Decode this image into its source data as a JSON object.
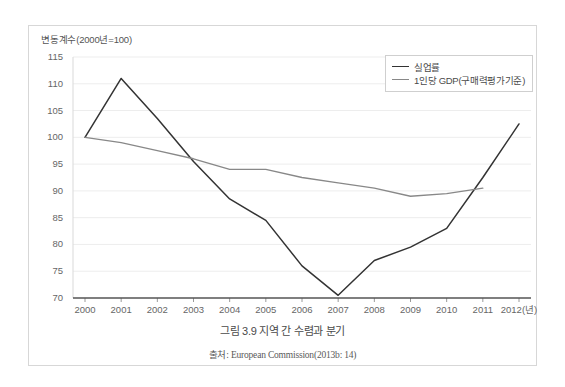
{
  "figure": {
    "caption": "그림 3.9 지역 간 수렴과 분기",
    "source": "출처: European Commission(2013b: 14)"
  },
  "colors": {
    "unemployment_line": "#333333",
    "gdp_line": "#888888",
    "gridline": "#ededed",
    "axis": "#555555",
    "frame_border": "#d7d7d7",
    "legend_border": "#cfcfcf",
    "tick_text": "#666666"
  },
  "chart_data": {
    "type": "line",
    "title": "변동계수(2000년=100)",
    "xlabel": "(년)",
    "ylabel": "변동계수(2000년=100)",
    "ylim": [
      70,
      115
    ],
    "xlim": [
      2000,
      2012
    ],
    "grid": true,
    "legend_position": "top-right",
    "yticks": [
      115,
      110,
      105,
      100,
      95,
      90,
      85,
      80,
      75,
      70
    ],
    "xticks": [
      "2000",
      "2001",
      "2002",
      "2003",
      "2004",
      "2005",
      "2006",
      "2007",
      "2008",
      "2009",
      "2010",
      "2011",
      "2012(년)"
    ],
    "x": [
      2000,
      2001,
      2002,
      2003,
      2004,
      2005,
      2006,
      2007,
      2008,
      2009,
      2010,
      2011,
      2012
    ],
    "series": [
      {
        "name": "실업률",
        "color": "#333333",
        "values": [
          100,
          111,
          103.5,
          95.5,
          88.5,
          84.5,
          76,
          70.5,
          77,
          79.5,
          83,
          92.5,
          102.5
        ]
      },
      {
        "name": "1인당 GDP(구매력평가기준)",
        "color": "#888888",
        "values": [
          100,
          99,
          97.5,
          96,
          94,
          94,
          92.5,
          91.5,
          90.5,
          89,
          89.5,
          90.5,
          null
        ]
      }
    ]
  }
}
